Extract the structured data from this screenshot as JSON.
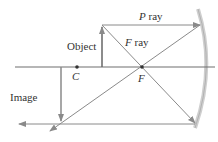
{
  "diagram": {
    "labels": {
      "object": "Object",
      "image": "Image",
      "center": "C",
      "focus": "F",
      "p_ray_letter": "P",
      "p_ray_word": " ray",
      "f_ray_letter": "F",
      "f_ray_word": " ray"
    },
    "colors": {
      "ray": "#8a8a8a",
      "axis": "#6f6f6f",
      "mirror": "#c8c8c8",
      "text": "#333333"
    }
  }
}
